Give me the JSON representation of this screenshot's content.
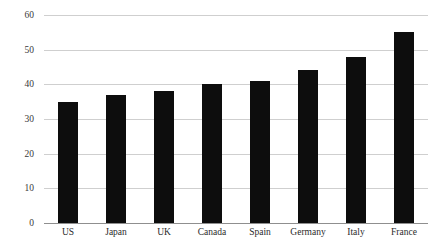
{
  "chart_data": {
    "type": "bar",
    "title": "",
    "xlabel": "",
    "ylabel": "",
    "categories": [
      "US",
      "Japan",
      "UK",
      "Canada",
      "Spain",
      "Germany",
      "Italy",
      "France"
    ],
    "values": [
      35,
      37,
      38,
      40,
      41,
      44,
      48,
      55
    ],
    "ylim": [
      0,
      60
    ],
    "ytick_values": [
      0,
      10,
      20,
      30,
      40,
      50,
      60
    ],
    "ytick_labels": [
      "0",
      "10",
      "20",
      "30",
      "40",
      "50",
      "60"
    ],
    "grid": "horizontal",
    "legend": "none",
    "bar_color": "#0d0d0d",
    "gridline_color": "#cfcfcf",
    "axis_color": "#8f8f8f",
    "background_color": "#ffffff"
  }
}
